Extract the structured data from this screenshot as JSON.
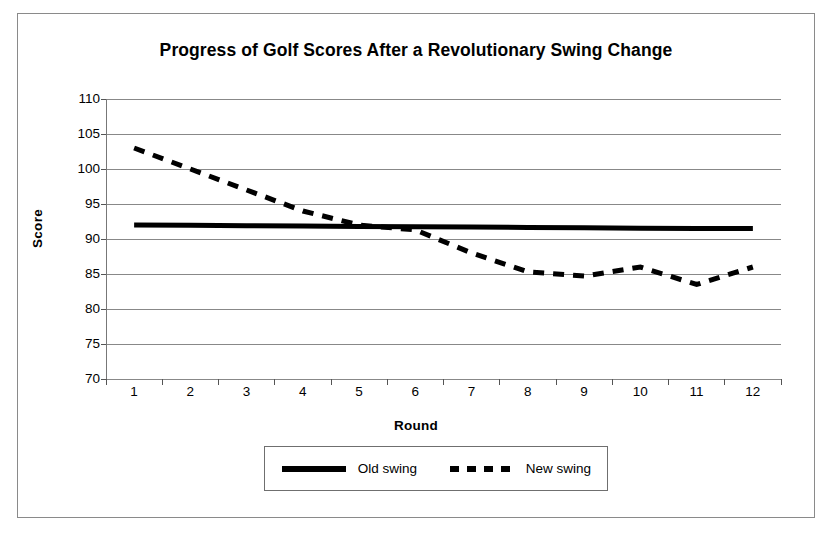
{
  "figure": {
    "title": "Progress of Golf Scores After a Revolutionary Swing Change"
  },
  "axes": {
    "y_title": "Score",
    "x_title": "Round"
  },
  "legend": {
    "entries": [
      {
        "label": "Old swing",
        "style": "solid",
        "color": "#000000"
      },
      {
        "label": "New swing",
        "style": "dashed",
        "color": "#000000"
      }
    ]
  },
  "chart_data": {
    "type": "line",
    "title": "Progress of Golf Scores After a Revolutionary Swing Change",
    "xlabel": "Round",
    "ylabel": "Score",
    "x": [
      1,
      2,
      3,
      4,
      5,
      6,
      7,
      8,
      9,
      10,
      11,
      12
    ],
    "categories": [
      "1",
      "2",
      "3",
      "4",
      "5",
      "6",
      "7",
      "8",
      "9",
      "10",
      "11",
      "12"
    ],
    "xlim": [
      0.5,
      12.5
    ],
    "ylim": [
      70,
      110
    ],
    "yticks": [
      70,
      75,
      80,
      85,
      90,
      95,
      100,
      105,
      110
    ],
    "ytick_labels": [
      "70",
      "75",
      "80",
      "85",
      "90",
      "95",
      "100",
      "105",
      "110"
    ],
    "grid": "horizontal",
    "legend_position": "bottom",
    "series": [
      {
        "name": "Old swing",
        "style": "solid",
        "color": "#000000",
        "linewidth": 5,
        "values": [
          92,
          91.95,
          91.9,
          91.85,
          91.8,
          91.75,
          91.7,
          91.65,
          91.6,
          91.55,
          91.5,
          91.5
        ]
      },
      {
        "name": "New swing",
        "style": "dashed",
        "color": "#000000",
        "linewidth": 5,
        "values": [
          103,
          100,
          97,
          94,
          92,
          91.3,
          88,
          85.3,
          84.7,
          86,
          83.5,
          86
        ]
      }
    ]
  }
}
